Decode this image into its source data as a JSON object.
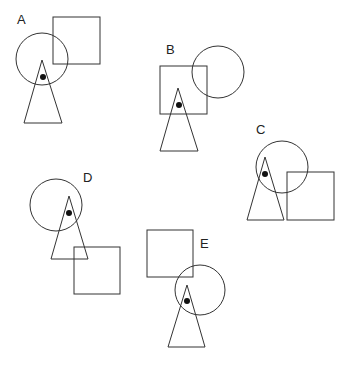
{
  "diagram": {
    "width": 352,
    "height": 369,
    "stroke_color": "#333333",
    "dot_color": "#111111",
    "figures": [
      {
        "label": "A",
        "label_pos": [
          17,
          24
        ],
        "square": {
          "x": 53,
          "y": 17,
          "w": 47,
          "h": 47
        },
        "circle": {
          "cx": 42,
          "cy": 59,
          "r": 26
        },
        "triangle": {
          "points": "42,60 24,123 62,123"
        },
        "dot": {
          "cx": 43,
          "cy": 77,
          "r": 3
        }
      },
      {
        "label": "B",
        "label_pos": [
          166,
          54
        ],
        "square": {
          "x": 160,
          "y": 66,
          "w": 47,
          "h": 48
        },
        "circle": {
          "cx": 218,
          "cy": 72,
          "r": 26
        },
        "triangle": {
          "points": "178,88 160,151 198,151"
        },
        "dot": {
          "cx": 179,
          "cy": 105,
          "r": 3
        }
      },
      {
        "label": "C",
        "label_pos": [
          256,
          134
        ],
        "square": {
          "x": 287,
          "y": 172,
          "w": 47,
          "h": 48
        },
        "circle": {
          "cx": 282,
          "cy": 167,
          "r": 26
        },
        "triangle": {
          "points": "265,157 247,220 284,220"
        },
        "dot": {
          "cx": 265,
          "cy": 174,
          "r": 3
        }
      },
      {
        "label": "D",
        "label_pos": [
          83,
          182
        ],
        "square": {
          "x": 74,
          "y": 247,
          "w": 46,
          "h": 47
        },
        "circle": {
          "cx": 56,
          "cy": 205,
          "r": 26
        },
        "triangle": {
          "points": "69,196 51,259 88,259"
        },
        "dot": {
          "cx": 69,
          "cy": 213,
          "r": 3
        }
      },
      {
        "label": "E",
        "label_pos": [
          200,
          248
        ],
        "square": {
          "x": 147,
          "y": 230,
          "w": 46,
          "h": 47
        },
        "circle": {
          "cx": 200,
          "cy": 290,
          "r": 25
        },
        "triangle": {
          "points": "187,285 168,347 205,347"
        },
        "dot": {
          "cx": 187,
          "cy": 301,
          "r": 3
        }
      }
    ]
  }
}
